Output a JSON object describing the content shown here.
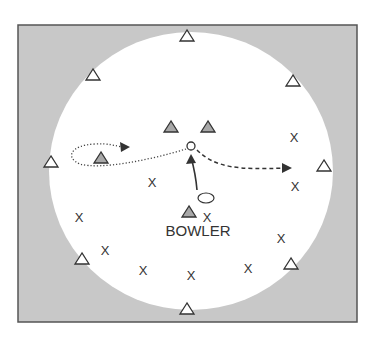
{
  "diagram": {
    "colors": {
      "outfield": "#c8c8c8",
      "field": "#ffffff",
      "border": "#555555",
      "ink": "#333333",
      "filled_triangle": "#a8a8a8"
    },
    "frame": {
      "x": 18,
      "y": 25,
      "width": 339,
      "height": 297
    },
    "field_circle": {
      "cx": 191,
      "cy": 171,
      "rx": 142,
      "ry": 139
    },
    "bowler_label": {
      "text": "BOWLER",
      "x": 198,
      "y": 236
    },
    "batsman": {
      "symbol": "O",
      "x": 191,
      "y": 146
    },
    "ball": {
      "x": 206,
      "y": 198,
      "rx": 8,
      "ry": 5
    },
    "outline_triangles": [
      {
        "x": 187,
        "y": 36
      },
      {
        "x": 93,
        "y": 75
      },
      {
        "x": 293,
        "y": 81
      },
      {
        "x": 51,
        "y": 162
      },
      {
        "x": 324,
        "y": 166
      },
      {
        "x": 82,
        "y": 259
      },
      {
        "x": 291,
        "y": 264
      },
      {
        "x": 187,
        "y": 309
      }
    ],
    "filled_triangles": [
      {
        "x": 171,
        "y": 127
      },
      {
        "x": 208,
        "y": 127
      },
      {
        "x": 101,
        "y": 158
      },
      {
        "x": 189,
        "y": 212
      }
    ],
    "x_marks": [
      {
        "label": "X",
        "x": 294,
        "y": 137
      },
      {
        "label": "X",
        "x": 152,
        "y": 182
      },
      {
        "label": "X",
        "x": 295,
        "y": 186
      },
      {
        "label": "X",
        "x": 79,
        "y": 217
      },
      {
        "label": "X",
        "x": 207,
        "y": 217
      },
      {
        "label": "X",
        "x": 105,
        "y": 250
      },
      {
        "label": "X",
        "x": 281,
        "y": 238
      },
      {
        "label": "X",
        "x": 143,
        "y": 270
      },
      {
        "label": "X",
        "x": 191,
        "y": 275
      },
      {
        "label": "X",
        "x": 248,
        "y": 268
      }
    ],
    "paths": {
      "bowl_solid": "M 197 190 C 196 178, 194 168, 191 157",
      "dotted_loop": "M 186 149 C 150 160, 100 170, 80 164 C 65 158, 70 145, 95 144 C 108 143, 116 146, 122 147",
      "dashed_run": "M 197 150 C 215 168, 240 170, 284 168"
    },
    "arrowheads": [
      {
        "name": "bowl-arrowhead",
        "points": "191,154 186,164 196,163"
      },
      {
        "name": "dotted-arrowhead",
        "points": "130,147 120,142 121,152"
      },
      {
        "name": "dashed-arrowhead",
        "points": "292,168 282,163 282,173"
      }
    ]
  }
}
